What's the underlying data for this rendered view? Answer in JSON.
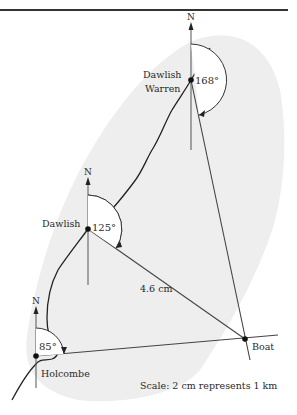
{
  "diagram": {
    "colors": {
      "land": "#efefef",
      "line": "#3a3a3a",
      "coast": "#222222",
      "text": "#2a2a2a",
      "rule": "#333333"
    },
    "places": [
      {
        "name": "Dawlish Warren",
        "line1": "Dawlish",
        "line2": "Warren",
        "x": 191,
        "y": 80
      },
      {
        "name": "Dawlish",
        "x": 88,
        "y": 229
      },
      {
        "name": "Holcombe",
        "x": 36,
        "y": 356
      },
      {
        "name": "Boat",
        "x": 245,
        "y": 339
      }
    ],
    "north_label": "N",
    "bearings": [
      {
        "from": "Dawlish Warren",
        "angle_label": "168°",
        "degrees": 168
      },
      {
        "from": "Dawlish",
        "angle_label": "125°",
        "degrees": 125
      },
      {
        "from": "Holcombe",
        "angle_label": "85°",
        "degrees": 85
      }
    ],
    "distance_label": "4.6 cm",
    "scale_text": "Scale: 2 cm represents 1 km"
  }
}
